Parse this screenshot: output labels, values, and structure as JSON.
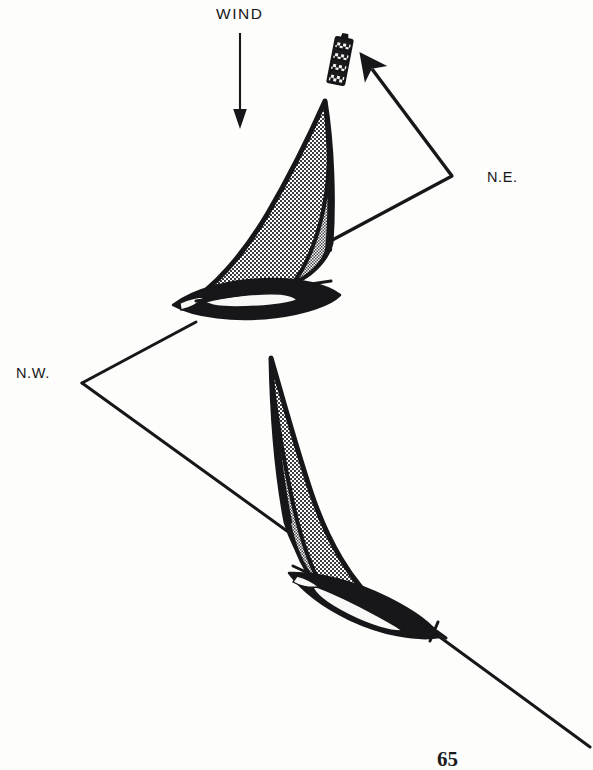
{
  "figure": {
    "kind": "sailing-tack-diagram",
    "background_color": "#fdfdfc",
    "ink_color": "#17171a",
    "page_number": "65"
  },
  "wind": {
    "label": "WIND",
    "direction": "from top of page downward (southbound)",
    "arrow": {
      "x": 240,
      "y_start": 33,
      "y_end": 128,
      "head_length": 17,
      "head_half_width": 6
    }
  },
  "labels": {
    "northeast": "N.E.",
    "northwest": "N.W."
  },
  "buoy": {
    "name": "racing-mark",
    "x": 332,
    "y": 38,
    "width": 17,
    "height": 46,
    "rotation_deg": 11,
    "band_count": 4,
    "color": "#1b1b1e"
  },
  "course_track": {
    "description": "Zig-zag beat: boat tacks from N.W. heading to N.E. heading and back while working upwind to the mark.",
    "points": [
      {
        "x": 590,
        "y": 747,
        "note": "start of track, lower right"
      },
      {
        "x": 436,
        "y": 634,
        "note": "lower boat bow"
      },
      {
        "x": 287,
        "y": 531,
        "note": "lower boat stern / track enters boat"
      },
      {
        "x": 82,
        "y": 383,
        "note": "N.W. tack turning point"
      },
      {
        "x": 196,
        "y": 323,
        "note": "upper boat hull"
      },
      {
        "x": 322,
        "y": 245,
        "note": "track leaves upper boat"
      },
      {
        "x": 452,
        "y": 176,
        "note": "N.E. tack turning point"
      },
      {
        "x": 368,
        "y": 66,
        "note": "arrowhead pointing at the mark"
      }
    ],
    "arrowhead_at_end": true,
    "line_width": 3.2
  },
  "boats": [
    {
      "name": "upper-sailboat",
      "heading": "port tack, heading up-left toward N.W.",
      "bow": {
        "x": 183,
        "y": 305
      },
      "stern": {
        "x": 322,
        "y": 286
      },
      "mast_tip": {
        "x": 325,
        "y": 100
      },
      "sails": [
        "mainsail",
        "jib"
      ],
      "sail_fill": "stipple-halftone"
    },
    {
      "name": "lower-sailboat",
      "heading": "starboard tack, heading down-right toward N.E.",
      "bow": {
        "x": 437,
        "y": 633
      },
      "stern": {
        "x": 300,
        "y": 585
      },
      "mast_tip": {
        "x": 271,
        "y": 357
      },
      "sails": [
        "mainsail",
        "jib"
      ],
      "sail_fill": "stipple-halftone"
    }
  ]
}
